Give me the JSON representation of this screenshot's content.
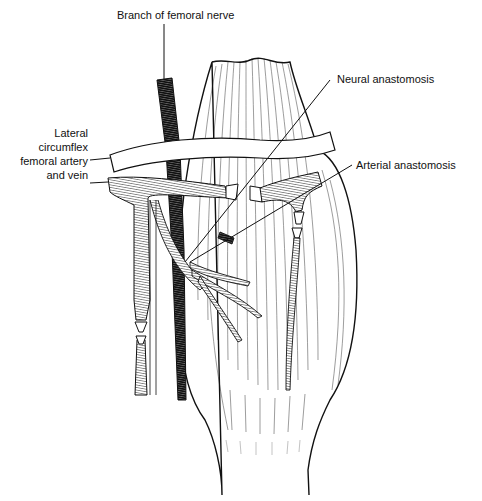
{
  "figure": {
    "colors": {
      "ink": "#111111",
      "background": "#ffffff"
    },
    "labels": {
      "nerve": "Branch of femoral nerve",
      "neural": "Neural anastomosis",
      "arterial": "Arterial anastomosis",
      "vessel_line1": "Lateral",
      "vessel_line2": "circumflex",
      "vessel_line3": "femoral artery",
      "vessel_line4": "and vein"
    }
  }
}
